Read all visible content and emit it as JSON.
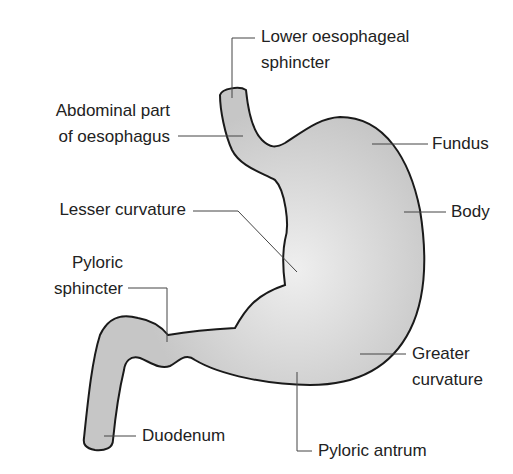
{
  "diagram": {
    "colors": {
      "fill": "#c8c8c8",
      "highlight": "#ececec",
      "outline": "#1a1a1a",
      "leader": "#555555",
      "text": "#222222"
    },
    "labels": {
      "lower_oesophageal_sphincter": {
        "line1": "Lower oesophageal",
        "line2": "sphincter"
      },
      "abdominal_oesophagus": {
        "line1": "Abdominal part",
        "line2": "of oesophagus"
      },
      "fundus": {
        "line1": "Fundus"
      },
      "lesser_curvature": {
        "line1": "Lesser curvature"
      },
      "body": {
        "line1": "Body"
      },
      "pyloric_sphincter": {
        "line1": "Pyloric",
        "line2": "sphincter"
      },
      "greater_curvature": {
        "line1": "Greater",
        "line2": "curvature"
      },
      "duodenum": {
        "line1": "Duodenum"
      },
      "pyloric_antrum": {
        "line1": "Pyloric antrum"
      }
    }
  }
}
